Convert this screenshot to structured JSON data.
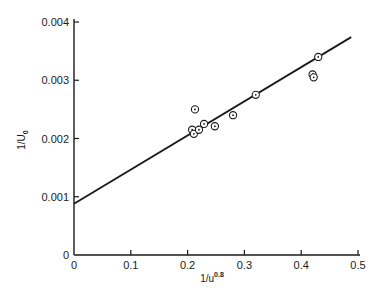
{
  "chart_data": {
    "type": "scatter",
    "title": "",
    "xlabel": "1/u",
    "xlabel_superscript": "0.8",
    "ylabel": "1/U",
    "ylabel_subscript": "0",
    "xlim": [
      0,
      0.5
    ],
    "ylim": [
      0,
      0.004
    ],
    "x_ticks": [
      0,
      0.1,
      0.2,
      0.3,
      0.4,
      0.5
    ],
    "x_tick_labels": [
      "0",
      "0.1",
      "0.2",
      "0.3",
      "0.4",
      "0.5"
    ],
    "y_ticks": [
      0,
      0.001,
      0.002,
      0.003,
      0.004
    ],
    "y_tick_labels": [
      "0",
      "0.001",
      "0.002",
      "0.003",
      "0.004"
    ],
    "grid": false,
    "legend": null,
    "series": [
      {
        "name": "measured",
        "marker": "circle-dot",
        "points": [
          {
            "x": 0.213,
            "y": 0.0025
          },
          {
            "x": 0.208,
            "y": 0.00215
          },
          {
            "x": 0.211,
            "y": 0.00208
          },
          {
            "x": 0.22,
            "y": 0.00215
          },
          {
            "x": 0.229,
            "y": 0.00225
          },
          {
            "x": 0.248,
            "y": 0.00221
          },
          {
            "x": 0.28,
            "y": 0.0024
          },
          {
            "x": 0.32,
            "y": 0.00275
          },
          {
            "x": 0.42,
            "y": 0.0031
          },
          {
            "x": 0.422,
            "y": 0.00305
          },
          {
            "x": 0.43,
            "y": 0.0034
          }
        ]
      },
      {
        "name": "fit",
        "type": "line",
        "points": [
          {
            "x": 0,
            "y": 0.00088
          },
          {
            "x": 0.488,
            "y": 0.00374
          }
        ]
      }
    ]
  }
}
